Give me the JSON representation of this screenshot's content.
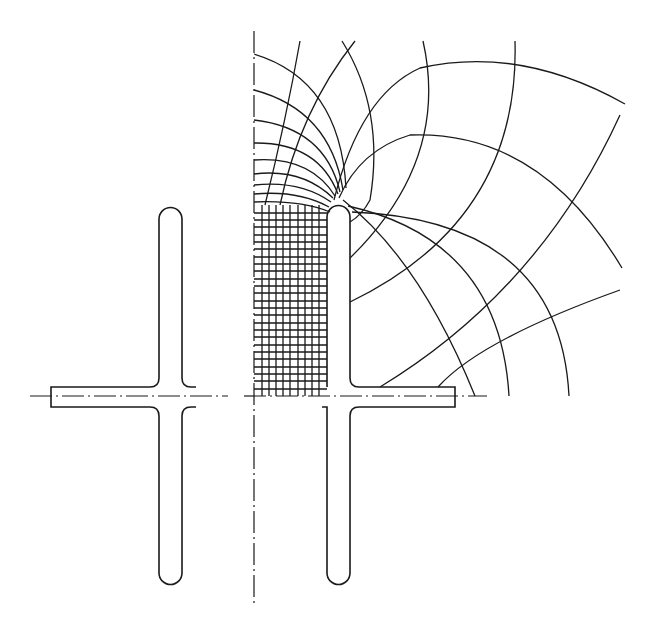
{
  "figure": {
    "type": "electrostatic field plot",
    "colors": {
      "ink": "#1a1a1a",
      "background": "#ffffff"
    },
    "axes": {
      "vertical_symmetry_axis": {
        "x": 254,
        "y1": 31,
        "y2": 607,
        "style": "dash-dot"
      },
      "horizontal_axis": {
        "y": 396,
        "x1": 30,
        "x2": 487,
        "style": "dash-dot"
      }
    },
    "electrodes": [
      {
        "name": "left-electrode",
        "bar": {
          "x": 159,
          "y": 207,
          "w": 23,
          "h": 378
        },
        "flange": {
          "x1": 51,
          "y1": 387,
          "y2": 407
        }
      },
      {
        "name": "right-electrode",
        "bar": {
          "x": 327,
          "y": 205,
          "w": 23,
          "h": 380
        },
        "flange": {
          "x2": 455,
          "y1": 387,
          "y2": 407
        }
      }
    ],
    "mesh": {
      "uniform_grid": {
        "x_from": 254,
        "x_to": 327,
        "y_from": 205,
        "y_to": 396,
        "spacing": 7.3
      },
      "equipotential_axis_intercepts_y": [
        54,
        90,
        120,
        143,
        160,
        174,
        185,
        194,
        202
      ],
      "field_line_top_ends_x": [
        299,
        342,
        355,
        423,
        515
      ],
      "flange_arc_ends_x": [
        380,
        438,
        475,
        509,
        569
      ]
    }
  }
}
